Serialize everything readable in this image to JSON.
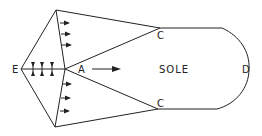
{
  "diagram": {
    "labels": {
      "E": "E",
      "A": "A",
      "C_top": "C",
      "C_bottom": "C",
      "D": "D",
      "sole": "SOLE"
    },
    "line_color": "#222222",
    "background": "#ffffff"
  }
}
